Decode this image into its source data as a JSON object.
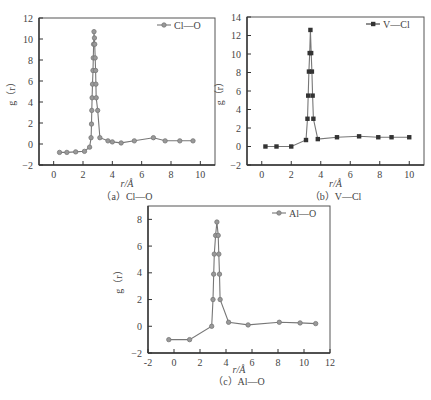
{
  "chart_data": [
    {
      "id": "a",
      "type": "line",
      "title": "",
      "caption": "（a）Cl—O",
      "xlabel": "r/Å",
      "ylabel": "g（r）",
      "xlim": [
        -1,
        11
      ],
      "ylim": [
        -2,
        12
      ],
      "xticks": [
        0,
        2,
        4,
        6,
        8,
        10
      ],
      "yticks": [
        -2,
        0,
        2,
        4,
        6,
        8,
        10,
        12
      ],
      "grid": false,
      "legend_position": "top-right",
      "marker": "circle",
      "color": "#777777",
      "series": [
        {
          "name": "Cl—O",
          "x": [
            0.4,
            0.9,
            1.5,
            2.1,
            2.45,
            2.55,
            2.58,
            2.6,
            2.62,
            2.65,
            2.68,
            2.7,
            2.72,
            2.75,
            2.78,
            2.8,
            2.83,
            2.86,
            2.88,
            2.9,
            3.0,
            3.15,
            3.7,
            4.0,
            4.6,
            5.5,
            6.8,
            7.6,
            8.6,
            9.5
          ],
          "y": [
            -0.8,
            -0.8,
            -0.75,
            -0.7,
            -0.3,
            0.6,
            1.9,
            3.2,
            4.4,
            5.7,
            7.0,
            8.2,
            9.5,
            10.7,
            10.1,
            9.5,
            8.2,
            7.0,
            5.7,
            4.4,
            3.2,
            0.6,
            0.3,
            0.2,
            0.1,
            0.3,
            0.6,
            0.3,
            0.3,
            0.3
          ]
        }
      ]
    },
    {
      "id": "b",
      "type": "line",
      "title": "",
      "caption": "（b）V—Cl",
      "xlabel": "r/Å",
      "ylabel": "g（r）",
      "xlim": [
        -1,
        11
      ],
      "ylim": [
        -2,
        14
      ],
      "xticks": [
        0,
        2,
        4,
        6,
        8,
        10
      ],
      "yticks": [
        -2,
        0,
        2,
        4,
        6,
        8,
        10,
        12,
        14
      ],
      "grid": false,
      "legend_position": "top-right",
      "marker": "square",
      "color": "#333333",
      "series": [
        {
          "name": "V—Cl",
          "x": [
            0.25,
            1.0,
            2.0,
            3.0,
            3.1,
            3.15,
            3.2,
            3.25,
            3.3,
            3.35,
            3.4,
            3.45,
            3.5,
            3.8,
            5.1,
            6.6,
            7.9,
            8.8,
            10.0
          ],
          "y": [
            0.0,
            0.0,
            0.0,
            0.7,
            3.0,
            5.5,
            8.1,
            10.1,
            12.6,
            10.1,
            8.1,
            5.5,
            3.0,
            0.8,
            1.0,
            1.1,
            1.0,
            1.0,
            1.0
          ]
        }
      ]
    },
    {
      "id": "c",
      "type": "line",
      "title": "",
      "caption": "（c）Al—O",
      "xlabel": "r/Å",
      "ylabel": "g（r）",
      "xlim": [
        -2,
        12
      ],
      "ylim": [
        -2,
        9
      ],
      "xticks": [
        -2,
        0,
        2,
        4,
        6,
        8,
        10,
        12
      ],
      "yticks": [
        -2,
        0,
        2,
        4,
        6,
        8
      ],
      "grid": false,
      "legend_position": "top-right",
      "marker": "circle",
      "color": "#777777",
      "series": [
        {
          "name": "Al—O",
          "x": [
            -0.4,
            1.2,
            2.9,
            3.0,
            3.05,
            3.1,
            3.2,
            3.3,
            3.4,
            3.45,
            3.5,
            3.55,
            4.2,
            5.7,
            8.1,
            9.7,
            10.9
          ],
          "y": [
            -1.0,
            -1.0,
            0.0,
            2.0,
            3.9,
            5.4,
            6.8,
            7.8,
            6.8,
            5.4,
            3.9,
            2.0,
            0.3,
            0.1,
            0.3,
            0.25,
            0.2
          ]
        }
      ]
    }
  ]
}
